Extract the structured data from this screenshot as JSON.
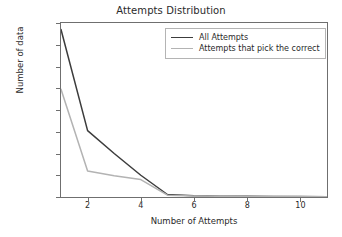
{
  "chart_data": {
    "type": "line",
    "title": "Attempts Distribution",
    "xlabel": "Number of Attempts",
    "ylabel": "Number of data",
    "xlim": [
      1,
      11
    ],
    "ylim": [
      0,
      16000
    ],
    "xticks": [
      2,
      4,
      6,
      8,
      10
    ],
    "xtick_labels": [
      "2",
      "4",
      "6",
      "8",
      "10"
    ],
    "yticks": [
      0,
      2000,
      4000,
      6000,
      8000,
      10000,
      12000,
      14000,
      16000
    ],
    "ytick_labels": [
      "0",
      "2000",
      "4000",
      "6000",
      "8000",
      "10000",
      "12000",
      "14000",
      "16000"
    ],
    "grid": false,
    "legend_position": "upper right",
    "x": [
      1,
      2,
      3,
      4,
      5,
      6,
      7,
      8,
      9,
      10,
      11
    ],
    "series": [
      {
        "name": "All Attempts",
        "color": "#3c3c3c",
        "values": [
          15400,
          6100,
          4000,
          2000,
          230,
          120,
          80,
          60,
          45,
          35,
          30
        ]
      },
      {
        "name": "Attempts that pick the correct",
        "color": "#b3b3b3",
        "values": [
          9900,
          2400,
          1950,
          1600,
          170,
          95,
          65,
          50,
          38,
          30,
          25
        ]
      }
    ]
  },
  "legend": {
    "items": [
      {
        "label": "All Attempts"
      },
      {
        "label": "Attempts that pick the correct"
      }
    ]
  },
  "axis_titles": {
    "x": "Number of Attempts",
    "y": "Number of data"
  },
  "title": "Attempts Distribution"
}
